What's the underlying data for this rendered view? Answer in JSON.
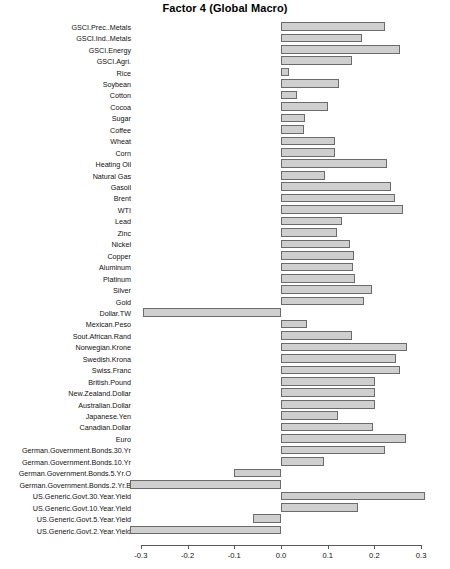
{
  "chart_data": {
    "type": "bar",
    "orientation": "horizontal",
    "title": "Factor 4 (Global Macro)",
    "xlabel": "",
    "ylabel": "",
    "xlim": [
      -0.34,
      0.34
    ],
    "grid": false,
    "legend": null,
    "xticks": [
      -0.3,
      -0.2,
      -0.1,
      0.0,
      0.1,
      0.2,
      0.3
    ],
    "xticklabels": [
      "-0.3",
      "-0.2",
      "-0.1",
      "0.0",
      "0.1",
      "0.2",
      "0.3"
    ],
    "bar_fill_color": "#cfcfcf",
    "bar_edge_color": "#6b6b6b",
    "categories": [
      "GSCI.Prec..Metals",
      "GSCI.Ind..Metals",
      "GSCI.Energy",
      "GSCI.Agri.",
      "Rice",
      "Soybean",
      "Cotton",
      "Cocoa",
      "Sugar",
      "Coffee",
      "Wheat",
      "Corn",
      "Heating Oil",
      "Natural Gas",
      "Gasoil",
      "Brent",
      "WTI",
      "Lead",
      "Zinc",
      "Nickel",
      "Copper",
      "Aluminum",
      "Platinum",
      "Silver",
      "Gold",
      "Dollar.TW",
      "Mexican.Peso",
      "Sout.African.Rand",
      "Norwegian.Krone",
      "Swedish.Krona",
      "Swiss.Franc",
      "British.Pound",
      "New.Zealand.Dollar",
      "Australian.Dollar",
      "Japanese.Yen",
      "Canadian.Dollar",
      "Euro",
      "German.Government.Bonds.30.Yr",
      "German.Government.Bonds.10.Yr",
      "German.Government.Bonds.5.Yr.O",
      "German.Government.Bonds.2.Yr.B",
      "US.Generic.Govt.30.Year.Yield",
      "US.Generic.Govt.10.Year.Yield",
      "US.Generic.Govt.5.Year.Yield",
      "US.Generic.Govt.2.Year.Yield"
    ],
    "values": [
      0.223,
      0.174,
      0.255,
      0.152,
      0.018,
      0.124,
      0.035,
      0.101,
      0.052,
      0.049,
      0.116,
      0.116,
      0.227,
      0.094,
      0.236,
      0.244,
      0.262,
      0.131,
      0.119,
      0.148,
      0.157,
      0.155,
      0.158,
      0.194,
      0.178,
      -0.295,
      0.055,
      0.152,
      0.27,
      0.246,
      0.255,
      0.202,
      0.201,
      0.202,
      0.121,
      0.197,
      0.267,
      0.222,
      0.092,
      -0.101,
      -0.323,
      0.308,
      0.164,
      -0.06,
      -0.323
    ]
  }
}
